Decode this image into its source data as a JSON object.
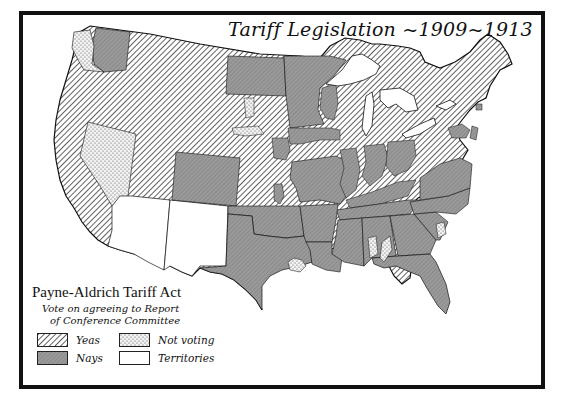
{
  "map": {
    "title": "Tariff Legislation ~1909~1913",
    "subject": "Payne-Aldrich Tariff Act",
    "region": "United States (contiguous, 1909)",
    "colors": {
      "frame": "#111111",
      "background": "#ffffff",
      "nays_fill": "#8c8c8c",
      "yeas_hatch": "#333333",
      "not_voting_dots": "#444444",
      "territories_fill": "#ffffff"
    }
  },
  "legend": {
    "title": "Payne-Aldrich Tariff Act",
    "subtitle_line1": "Vote on agreeing to Report",
    "subtitle_line2": "of Conference Committee",
    "items": [
      {
        "label": "Yeas",
        "pattern": "diagonal-hatch"
      },
      {
        "label": "Not voting",
        "pattern": "dotted"
      },
      {
        "label": "Nays",
        "pattern": "solid-gray"
      },
      {
        "label": "Territories",
        "pattern": "white"
      }
    ]
  },
  "regions": {
    "yeas": [
      "Oregon",
      "California",
      "Idaho",
      "Montana",
      "Wyoming",
      "Utah",
      "South Dakota",
      "Nebraska",
      "Kansas",
      "Iowa (most)",
      "Wisconsin (most)",
      "Michigan",
      "Illinois (north)",
      "Indiana (parts)",
      "Ohio (parts)",
      "Pennsylvania",
      "New York",
      "Vermont",
      "New Hampshire",
      "Maine",
      "Massachusetts",
      "Connecticut",
      "Rhode Island",
      "New Jersey",
      "West Virginia (most)",
      "Kentucky (east)",
      "Louisiana (south coast)"
    ],
    "nays": [
      "Washington (east)",
      "North Dakota",
      "Minnesota",
      "Colorado",
      "Oklahoma",
      "Texas",
      "Missouri",
      "Arkansas",
      "Louisiana",
      "Mississippi",
      "Alabama",
      "Tennessee",
      "Georgia",
      "Florida",
      "South Carolina",
      "North Carolina",
      "Virginia",
      "Maryland",
      "Delaware"
    ],
    "not_voting": [
      "Nevada",
      "Washington (west)",
      "South Dakota (parts)",
      "Texas (north-central)",
      "Alabama (parts)",
      "South Carolina (coast)"
    ],
    "territories": [
      "Arizona",
      "New Mexico"
    ]
  }
}
